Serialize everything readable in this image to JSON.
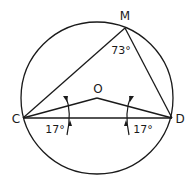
{
  "diagram": {
    "type": "circle-geometry",
    "circle": {
      "center_label": "O"
    },
    "points": {
      "M": {
        "label": "M"
      },
      "C": {
        "label": "C"
      },
      "D": {
        "label": "D"
      },
      "O": {
        "label": "O"
      }
    },
    "angles": {
      "CMD": {
        "label": "73°",
        "value": 73
      },
      "OCD": {
        "label": "17°",
        "value": 17
      },
      "ODC": {
        "label": "17°",
        "value": 17
      }
    },
    "segments": [
      "CM",
      "MD",
      "CD",
      "CO",
      "OD"
    ],
    "stroke_color": "#1a1a1a",
    "background": "#ffffff"
  }
}
